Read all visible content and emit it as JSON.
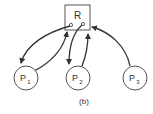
{
  "diagram": {
    "type": "resource-allocation-graph",
    "caption": "(b)",
    "resource": {
      "label": "R",
      "instances": 2
    },
    "processes": [
      {
        "id": "p1",
        "label": "P",
        "subscript": "1"
      },
      {
        "id": "p2",
        "label": "P",
        "subscript": "2"
      },
      {
        "id": "p3",
        "label": "P",
        "subscript": "3"
      }
    ],
    "edges": [
      {
        "from": "R",
        "to": "P1",
        "kind": "assignment"
      },
      {
        "from": "P1",
        "to": "R",
        "kind": "request"
      },
      {
        "from": "R",
        "to": "P2",
        "kind": "assignment"
      },
      {
        "from": "P2",
        "to": "R",
        "kind": "request"
      },
      {
        "from": "P3",
        "to": "R",
        "kind": "request"
      }
    ],
    "colors": {
      "stroke": "#333333",
      "background": "#ffffff"
    }
  }
}
